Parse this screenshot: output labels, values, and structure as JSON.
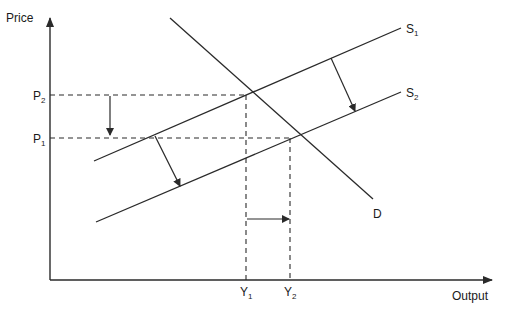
{
  "diagram": {
    "colors": {
      "line": "#2a2a2a",
      "text": "#1a1a1a",
      "background": "#ffffff"
    },
    "axes": {
      "y_label": "Price",
      "x_label": "Output"
    },
    "curves": {
      "s1": {
        "label": "S",
        "sub": "1"
      },
      "s2": {
        "label": "S",
        "sub": "2"
      },
      "d": {
        "label": "D"
      }
    },
    "price_ticks": [
      {
        "label": "P",
        "sub": "2"
      },
      {
        "label": "P",
        "sub": "1"
      }
    ],
    "output_ticks": [
      {
        "label": "Y",
        "sub": "1"
      },
      {
        "label": "Y",
        "sub": "2"
      }
    ],
    "arrows": [
      "supply-shift-arrow-left",
      "supply-shift-arrow-right",
      "price-fall-arrow",
      "output-rise-arrow"
    ]
  }
}
